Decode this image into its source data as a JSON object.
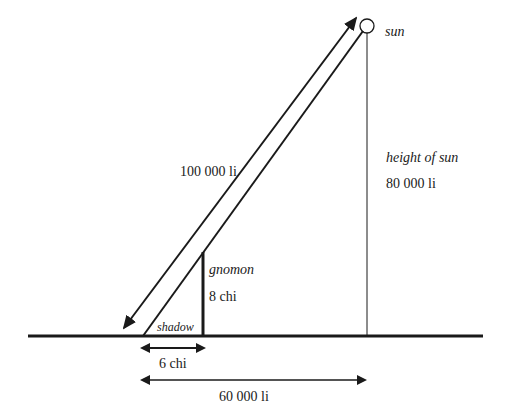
{
  "diagram": {
    "type": "gnomon-shadow sun-height geometry",
    "labels": {
      "sun": "sun",
      "height_of_sun": "height of sun",
      "height_value": "80 000 li",
      "hypotenuse_value": "100 000 li",
      "gnomon": "gnomon",
      "gnomon_height": "8 chi",
      "shadow": "shadow",
      "shadow_length": "6 chi",
      "ground_distance": "60 000 li"
    },
    "colors": {
      "ink": "#1a1a1a",
      "background": "#ffffff"
    }
  }
}
